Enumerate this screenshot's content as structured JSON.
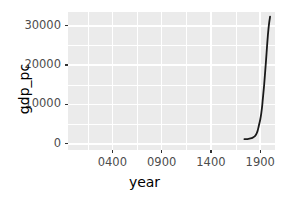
{
  "chart_data": {
    "type": "line",
    "title": "",
    "xlabel": "year",
    "ylabel": "gdp_pc",
    "xlim": [
      -50,
      2050
    ],
    "ylim": [
      -1600,
      33500
    ],
    "grid": true,
    "legend": "none",
    "line_color": "#1a1a1a",
    "panel_background": "#ebebeb",
    "gridline_color": "#ffffff",
    "x_ticks": [
      400,
      900,
      1400,
      1900
    ],
    "x_tick_labels": [
      "0400",
      "0900",
      "1400",
      "1900"
    ],
    "x_minor_ticks": [
      150,
      650,
      1150,
      1650
    ],
    "y_ticks": [
      0,
      10000,
      20000,
      30000
    ],
    "y_tick_labels": [
      "0",
      "10000",
      "20000",
      "30000"
    ],
    "y_minor_ticks": [
      5000,
      15000,
      25000
    ],
    "series": [
      {
        "name": "gdp_pc",
        "x": [
          1740,
          1760,
          1780,
          1800,
          1820,
          1840,
          1855,
          1870,
          1880,
          1890,
          1900,
          1910,
          1920,
          1925,
          1930,
          1940,
          1950,
          1960,
          1970,
          1980,
          1990,
          2000
        ],
        "values": [
          1150,
          1180,
          1250,
          1350,
          1500,
          1800,
          2200,
          3000,
          3900,
          5000,
          6100,
          7600,
          9600,
          11000,
          12300,
          15000,
          18200,
          21500,
          25000,
          28200,
          30600,
          32300
        ]
      }
    ]
  },
  "axes": {
    "y_title": "gdp_pc",
    "x_title": "year"
  }
}
